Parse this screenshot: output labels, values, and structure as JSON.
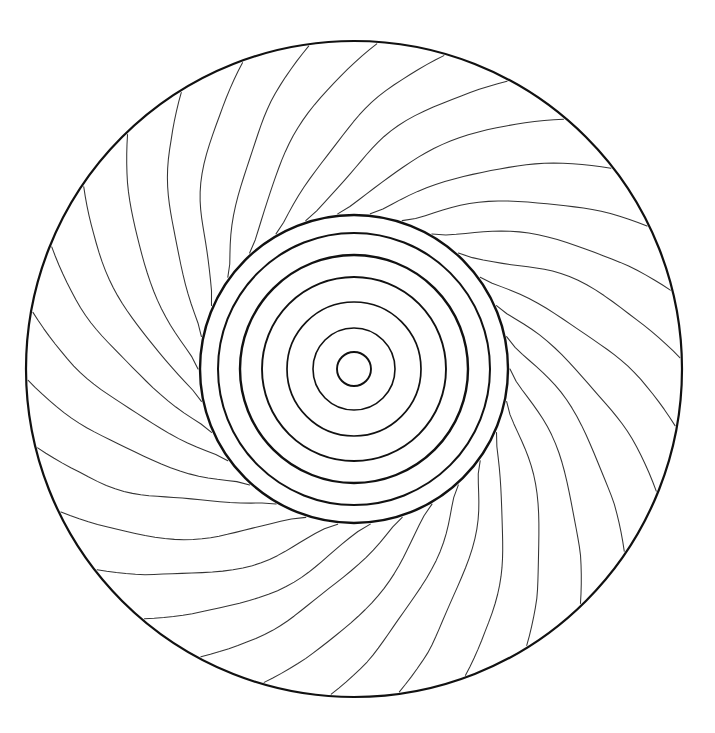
{
  "page": {
    "kind": "line-art-illustration",
    "background_color": "#ffffff",
    "line_color": "#111111",
    "ray_line_color": "#333333",
    "canvas": {
      "width": 715,
      "height": 733
    }
  },
  "figure": {
    "center": {
      "x": 354,
      "y": 369
    },
    "outer_boundary": {
      "name": "outer-circle",
      "radius": 328,
      "stroke_width": 2.2,
      "stroke": "#111111"
    },
    "concentric_rings": [
      {
        "index": 1,
        "radius": 154,
        "stroke_width": 2.4
      },
      {
        "index": 2,
        "radius": 136,
        "stroke_width": 2.0
      },
      {
        "index": 3,
        "radius": 114,
        "stroke_width": 2.4
      },
      {
        "index": 4,
        "radius": 92,
        "stroke_width": 1.9
      },
      {
        "index": 5,
        "radius": 67,
        "stroke_width": 1.7
      },
      {
        "index": 6,
        "radius": 41,
        "stroke_width": 1.6
      },
      {
        "index": 7,
        "radius": 17,
        "stroke_width": 1.9
      }
    ],
    "ring_count": 7,
    "rays": {
      "count": 30,
      "inner_radius": 156,
      "outer_radius": 326,
      "swirl_degrees": 46,
      "wobble_amplitude": 5,
      "start_angle_deg": -96,
      "stroke_width": 1.05,
      "description": "curved swirl strokes radiating from the inner disc to the outer boundary, each bending counter-clockwise"
    }
  }
}
